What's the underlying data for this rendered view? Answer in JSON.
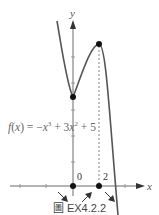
{
  "figure": {
    "function_label": "f(x) = −x³ + 3x² + 5",
    "function_label_parts": {
      "lhs": "f(x) = −x",
      "exp1": "3",
      "mid": " + 3x",
      "exp2": "2",
      "rhs": " + 5"
    },
    "y_axis_label": "y",
    "x_axis_label": "x",
    "x_tick_labels": [
      "0",
      "2"
    ],
    "critical_points": [
      {
        "x": 0,
        "y": 5,
        "type": "local-min"
      },
      {
        "x": 2,
        "y": 9,
        "type": "local-max"
      }
    ],
    "monotonic_arrows": [
      "decreasing",
      "increasing",
      "decreasing"
    ],
    "caption": "圖 EX4.2.2"
  }
}
